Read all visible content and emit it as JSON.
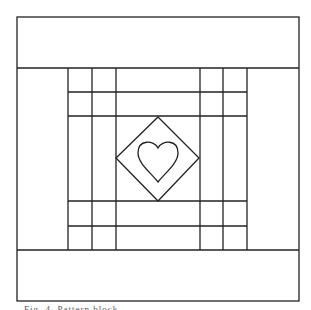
{
  "figure": {
    "type": "quilt-block-pattern",
    "stroke_color": "#222222",
    "background": "#ffffff",
    "outer_border": {
      "x1": 17,
      "y1": 17,
      "x2": 299,
      "y2": 301
    },
    "top_band_bottom_y": 68,
    "bottom_band_top_y": 250,
    "left_strip_verticals_x": [
      68,
      92,
      116
    ],
    "right_strip_verticals_x": [
      200,
      223,
      247
    ],
    "top_strip_horizontals_y": [
      92,
      116
    ],
    "bottom_strip_horizontals_y": [
      201,
      226
    ],
    "center_diamond": {
      "top": [
        158,
        117
      ],
      "right": [
        199,
        158
      ],
      "bottom": [
        158,
        201
      ],
      "left": [
        116,
        158
      ]
    },
    "center_shape": "heart"
  },
  "caption": {
    "text": "Fig. 4. Pattern block"
  }
}
